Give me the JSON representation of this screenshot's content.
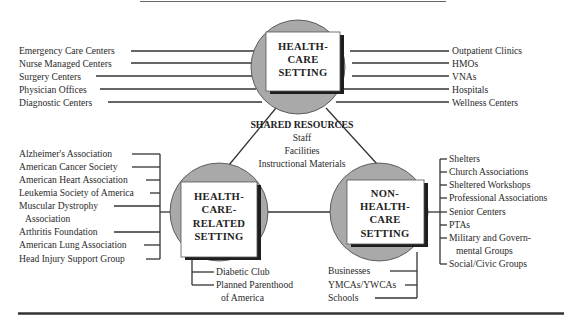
{
  "diagram": {
    "nodes": {
      "health_care_setting": {
        "title_lines": [
          "HEALTH-",
          "CARE",
          "SETTING"
        ],
        "left_items": [
          "Emergency Care Centers",
          "Nurse Managed Centers",
          "Surgery Centers",
          "Physician Offices",
          "Diagnostic Centers"
        ],
        "right_items": [
          "Outpatient Clinics",
          "HMOs",
          "VNAs",
          "Hospitals",
          "Wellness Centers"
        ]
      },
      "health_care_related_setting": {
        "title_lines": [
          "HEALTH-",
          "CARE-",
          "RELATED",
          "SETTING"
        ],
        "left_items": [
          "Alzheimer's Association",
          "American Cancer Society",
          "American Heart Association",
          "Leukemia Society of America",
          "Muscular Dystrophy",
          "Association",
          "Arthritis Foundation",
          "American Lung Association",
          "Head Injury Support Group"
        ],
        "bottom_items": [
          "Diabetic Club",
          "Planned Parenthood",
          "of America"
        ]
      },
      "non_health_care_setting": {
        "title_lines": [
          "NON-",
          "HEALTH-",
          "CARE",
          "SETTING"
        ],
        "right_items": [
          "Shelters",
          "Church Associations",
          "Sheltered Workshops",
          "Professional Associations",
          "Senior Centers",
          "PTAs",
          "Military and Govern-",
          "mental Groups",
          "Social/Civic Groups"
        ],
        "bottom_items": [
          "Businesses",
          "YMCAs/YWCAs",
          "Schools"
        ]
      }
    },
    "shared_resources": {
      "heading": "SHARED RESOURCES",
      "items": [
        "Staff",
        "Facilities",
        "Instructional Materials"
      ]
    }
  }
}
